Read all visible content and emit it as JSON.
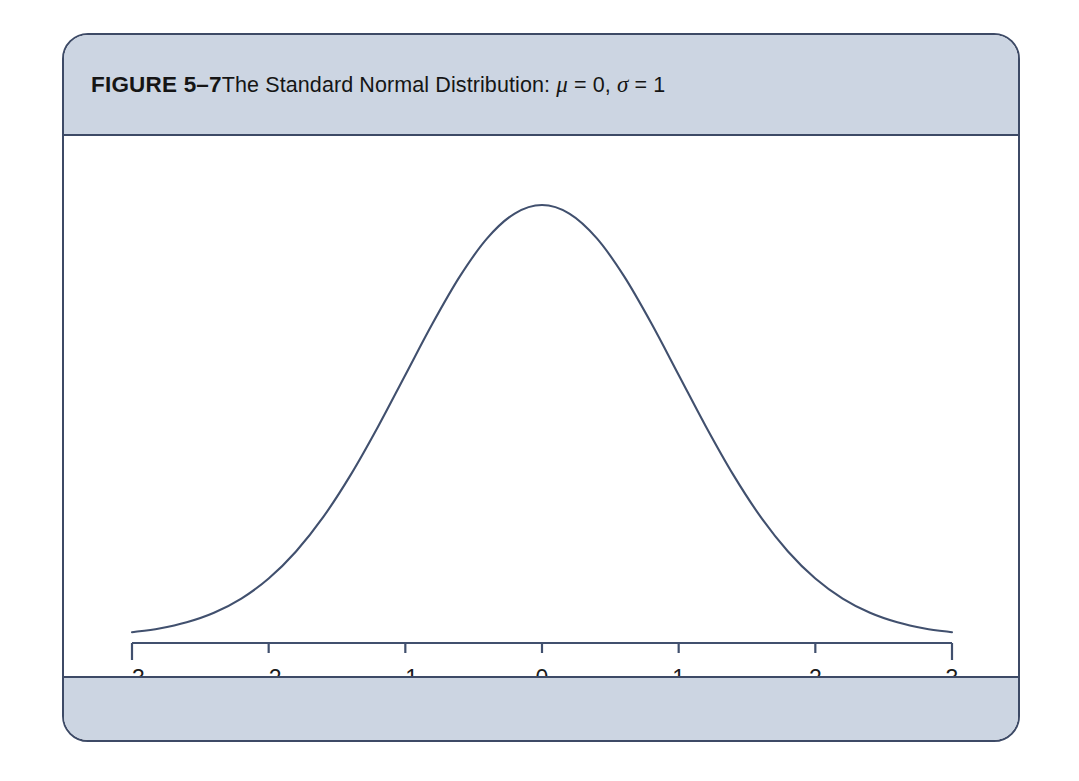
{
  "figure": {
    "label": "FIGURE 5–7",
    "caption_prefix": "The Standard Normal Distribution: ",
    "mu_symbol": "μ",
    "mu_eq": " = 0, ",
    "sigma_symbol": "σ",
    "sigma_eq": " = 1",
    "full_title": "FIGURE 5–7 The Standard Normal Distribution: μ = 0, σ = 1"
  },
  "colors": {
    "band": "#ccd5e2",
    "border": "#3d4a66",
    "curve": "#41506e",
    "axis": "#41506e",
    "text": "#151515",
    "plot_background": "#ffffff"
  },
  "chart_data": {
    "type": "line",
    "title": "The Standard Normal Distribution: μ = 0, σ = 1",
    "xlabel": "",
    "ylabel": "",
    "distribution": "standard normal",
    "mean": 0,
    "standard_deviation": 1,
    "xlim": [
      -3,
      3
    ],
    "ylim": [
      0,
      0.4
    ],
    "grid": false,
    "legend": null,
    "x_tick_labels": [
      "–3",
      "–2",
      "–1",
      "0",
      "1",
      "2",
      "3"
    ],
    "x_ticks": [
      -3,
      -2,
      -1,
      0,
      1,
      2,
      3
    ],
    "y_ticks": [],
    "x": [
      -3,
      -2.8,
      -2.6,
      -2.4,
      -2.2,
      -2,
      -1.8,
      -1.6,
      -1.4,
      -1.2,
      -1,
      -0.8,
      -0.6,
      -0.4,
      -0.2,
      0,
      0.2,
      0.4,
      0.6,
      0.8,
      1,
      1.2,
      1.4,
      1.6,
      1.8,
      2,
      2.2,
      2.4,
      2.6,
      2.8,
      3
    ],
    "y": [
      0.0044,
      0.0079,
      0.0136,
      0.0224,
      0.0355,
      0.054,
      0.079,
      0.1109,
      0.1497,
      0.1942,
      0.242,
      0.2897,
      0.3332,
      0.3683,
      0.391,
      0.3989,
      0.391,
      0.3683,
      0.3332,
      0.2897,
      0.242,
      0.1942,
      0.1497,
      0.1109,
      0.079,
      0.054,
      0.0355,
      0.0224,
      0.0136,
      0.0079,
      0.0044
    ]
  }
}
